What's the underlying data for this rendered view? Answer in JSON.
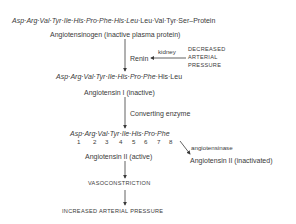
{
  "diagram": {
    "angiotensinogen": {
      "sequence_italic": "Asp·Arg·Val·Tyr·Ile·His·Pro·Phe·His·Leu",
      "sequence_rest": "·Leu·Val·Tyr·Ser–Protein",
      "label": "Angiotensinogen (inactive plasma protein)"
    },
    "renin_step": {
      "enzyme": "Renin",
      "source": "kidney",
      "trigger": [
        "DECREASED",
        "ARTERIAL",
        "PRESSURE"
      ]
    },
    "angiotensin_i": {
      "sequence_italic": "Asp·Arg·Val·Tyr·Ile·His·Pro·Phe",
      "sequence_rest": "·His·Leu",
      "label": "Angiotensin I (inactive)"
    },
    "converting_step": {
      "enzyme": "Converting enzyme"
    },
    "angiotensin_ii": {
      "sequence": "Asp·Arg·Val·Tyr·Ile·His·Pro·Phe",
      "positions": [
        "1",
        "2",
        "3",
        "4",
        "5",
        "6",
        "7",
        "8"
      ],
      "label": "Angiotensin II (active)"
    },
    "inactivation": {
      "enzyme": "angiotensinase",
      "product": "Angiotensin II (inactivated)"
    },
    "effect": "VASOCONSTRICTION",
    "outcome": "INCREASED ARTERIAL PRESSURE"
  }
}
